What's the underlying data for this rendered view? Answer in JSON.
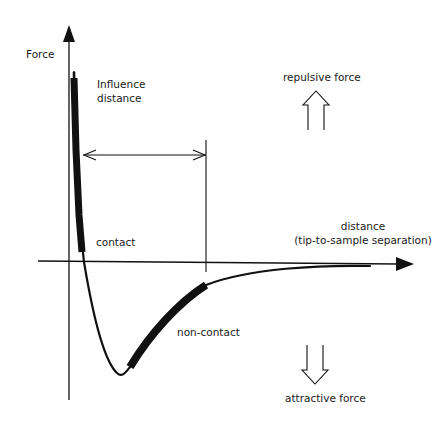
{
  "diagram": {
    "type": "force-distance curve (AFM)",
    "colors": {
      "ink": "#111111",
      "background": "#ffffff"
    },
    "axes": {
      "y_label": "Force",
      "x_label_line1": "distance",
      "x_label_line2": "(tip-to-sample separation)"
    },
    "regions": {
      "contact": "contact",
      "non_contact": "non-contact"
    },
    "annotations": {
      "influence_line1": "Influence",
      "influence_line2": "distance",
      "repulsive": "repulsive force",
      "attractive": "attractive force"
    },
    "icons": {
      "repulsive": "hollow-up-arrow-icon",
      "attractive": "hollow-down-arrow-icon"
    }
  }
}
